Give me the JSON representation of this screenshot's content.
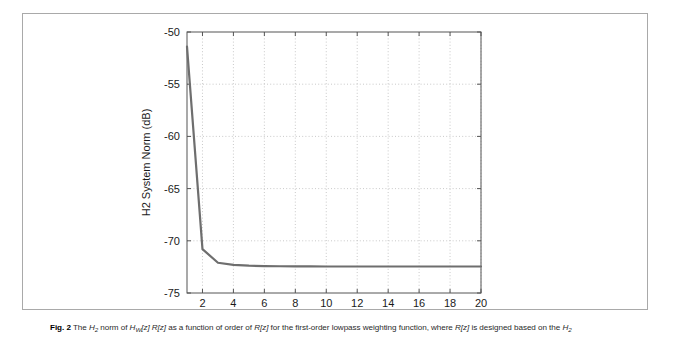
{
  "figure": {
    "label": "Fig. 2",
    "caption_parts": [
      {
        "t": "The ",
        "style": "plain"
      },
      {
        "t": "H",
        "style": "italic"
      },
      {
        "t": "2",
        "style": "sub-italic"
      },
      {
        "t": " norm of ",
        "style": "plain"
      },
      {
        "t": "H",
        "style": "italic"
      },
      {
        "t": "W",
        "style": "sub-italic"
      },
      {
        "t": "[z] ",
        "style": "italic"
      },
      {
        "t": "R",
        "style": "italic"
      },
      {
        "t": "[z] ",
        "style": "italic"
      },
      {
        "t": "as a function of order of ",
        "style": "plain"
      },
      {
        "t": "R",
        "style": "italic"
      },
      {
        "t": "[z] ",
        "style": "italic"
      },
      {
        "t": "for the first-order lowpass weighting function, where ",
        "style": "plain"
      },
      {
        "t": "R",
        "style": "italic"
      },
      {
        "t": "[z] ",
        "style": "italic"
      },
      {
        "t": "is designed based on the ",
        "style": "plain"
      },
      {
        "t": "H",
        "style": "italic"
      },
      {
        "t": "2",
        "style": "sub-italic"
      }
    ],
    "caption_plain": "Fig. 2 The H2 norm of HW[z] R[z] as a function of order of R[z] for the first-order lowpass weighting function, where R[z] is designed based on the H2"
  },
  "chart_data": {
    "type": "line",
    "title": "",
    "xlabel": "FIR Order",
    "ylabel": "H2 System Norm (dB)",
    "xlim": [
      1,
      20
    ],
    "ylim": [
      -75,
      -50
    ],
    "xticks": [
      2,
      4,
      6,
      8,
      10,
      12,
      14,
      16,
      18,
      20
    ],
    "yticks": [
      -75,
      -70,
      -65,
      -60,
      -55,
      -50
    ],
    "xtick_labels": [
      "2",
      "4",
      "6",
      "8",
      "10",
      "12",
      "14",
      "16",
      "18",
      "20"
    ],
    "ytick_labels": [
      "-75",
      "-70",
      "-65",
      "-60",
      "-55",
      "-50"
    ],
    "grid": true,
    "grid_style": "dotted",
    "legend": null,
    "series": [
      {
        "name": "H2 system norm",
        "color": "#6e6e6e",
        "line_width": 2.2,
        "x": [
          1,
          2,
          3,
          4,
          5,
          6,
          7,
          8,
          9,
          10,
          11,
          12,
          13,
          14,
          15,
          16,
          17,
          18,
          19,
          20
        ],
        "values": [
          -51.4,
          -70.8,
          -72.1,
          -72.3,
          -72.38,
          -72.42,
          -72.44,
          -72.45,
          -72.45,
          -72.46,
          -72.46,
          -72.46,
          -72.46,
          -72.46,
          -72.46,
          -72.46,
          -72.46,
          -72.46,
          -72.46,
          -72.46
        ]
      }
    ]
  },
  "colors": {
    "frame": "#a9a9a9",
    "axis": "#555555",
    "grid": "#bbbbbb",
    "line": "#6e6e6e",
    "text": "#1a1a1a",
    "caption": "#2a2a2a",
    "background": "#ffffff"
  }
}
